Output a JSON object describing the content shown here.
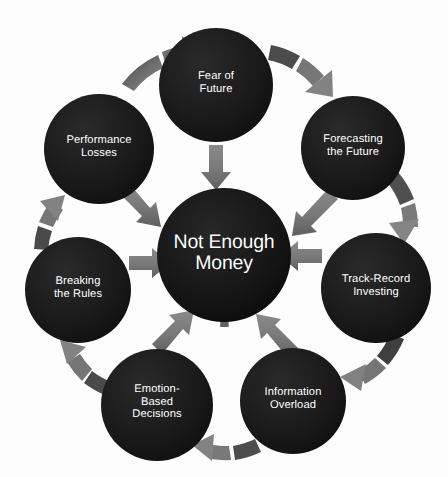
{
  "diagram": {
    "title": "Not Enough Money",
    "type": "circular-cycle-diagram",
    "colors": {
      "node_fill": "#1b1b1b",
      "node_text": "#ffffff",
      "arrow_fill": "#7d7d7d",
      "arrow_fill_dark": "#4a4a4a",
      "curve_fill": "#6f6f6f",
      "curve_fill_dark": "#3d3d3d",
      "watermark": "#5e5e5e",
      "background": "#fdfdfd"
    },
    "center": {
      "id": "center-node",
      "label": "Not Enough\nMoney",
      "line1": "Not Enough",
      "line2": "Money",
      "watermark_symbol": "$",
      "cx": 224,
      "cy": 255,
      "r": 67
    },
    "nodes": [
      {
        "id": "fear-of-future",
        "label": "Fear of\nFuture",
        "cx": 216,
        "cy": 85,
        "r": 57,
        "position": "top"
      },
      {
        "id": "forecasting-the-future",
        "label": "Forecasting\nthe Future",
        "cx": 353,
        "cy": 148,
        "r": 52,
        "position": "top-right"
      },
      {
        "id": "track-record-investing",
        "label": "Track-Record\nInvesting",
        "cx": 376,
        "cy": 288,
        "r": 55,
        "position": "right"
      },
      {
        "id": "information-overload",
        "label": "Information\nOverload",
        "cx": 293,
        "cy": 401,
        "r": 53,
        "position": "bottom-right"
      },
      {
        "id": "emotion-based-decisions",
        "label": "Emotion-\nBased\nDecisions",
        "cx": 157,
        "cy": 405,
        "r": 56,
        "position": "bottom-left"
      },
      {
        "id": "breaking-the-rules",
        "label": "Breaking\nthe Rules",
        "cx": 78,
        "cy": 290,
        "r": 53,
        "position": "left"
      },
      {
        "id": "performance-losses",
        "label": "Performance\nLosses",
        "cx": 99,
        "cy": 149,
        "r": 55,
        "position": "top-left"
      }
    ],
    "inward_arrows": [
      {
        "id": "arrow-fear-to-center",
        "from": "fear-of-future",
        "to": "center-node",
        "direction": "down"
      },
      {
        "id": "arrow-forecasting-to-center",
        "from": "forecasting-the-future",
        "to": "center-node",
        "direction": "down-left"
      },
      {
        "id": "arrow-track-record-to-center",
        "from": "track-record-investing",
        "to": "center-node",
        "direction": "left"
      },
      {
        "id": "arrow-information-to-center",
        "from": "information-overload",
        "to": "center-node",
        "direction": "up-left"
      },
      {
        "id": "arrow-emotion-to-center",
        "from": "emotion-based-decisions",
        "to": "center-node",
        "direction": "up-right"
      },
      {
        "id": "arrow-breaking-to-center",
        "from": "breaking-the-rules",
        "to": "center-node",
        "direction": "right"
      },
      {
        "id": "arrow-performance-to-center",
        "from": "performance-losses",
        "to": "center-node",
        "direction": "down-right"
      }
    ],
    "cycle_arrows": [
      {
        "id": "curve-performance-to-fear",
        "from": "performance-losses",
        "to": "fear-of-future"
      },
      {
        "id": "curve-fear-to-forecasting",
        "from": "fear-of-future",
        "to": "forecasting-the-future"
      },
      {
        "id": "curve-forecasting-to-track-record",
        "from": "forecasting-the-future",
        "to": "track-record-investing"
      },
      {
        "id": "curve-track-record-to-information",
        "from": "track-record-investing",
        "to": "information-overload"
      },
      {
        "id": "curve-information-to-emotion",
        "from": "information-overload",
        "to": "emotion-based-decisions"
      },
      {
        "id": "curve-emotion-to-breaking",
        "from": "emotion-based-decisions",
        "to": "breaking-the-rules"
      },
      {
        "id": "curve-breaking-to-performance",
        "from": "breaking-the-rules",
        "to": "performance-losses"
      }
    ]
  }
}
